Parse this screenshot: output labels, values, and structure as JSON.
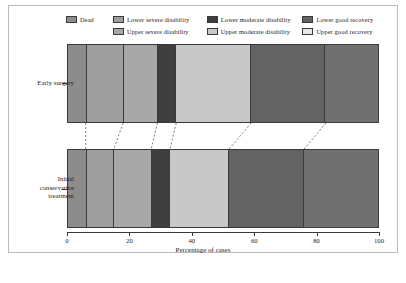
{
  "chart_data": {
    "type": "bar",
    "orientation": "horizontal",
    "stacked": true,
    "title": "",
    "xlabel": "Percentage of cases",
    "ylabel": "",
    "xlim": [
      0,
      100
    ],
    "xticks": [
      0,
      20,
      40,
      60,
      80,
      100
    ],
    "xtick_labels": [
      "0",
      "20",
      "40",
      "60",
      "80",
      "100"
    ],
    "grid": false,
    "legend_position": "top",
    "categories": [
      "Early surgery",
      "Initial conservative treatment"
    ],
    "category_label_lines": [
      [
        "Early surgery"
      ],
      [
        "Initial",
        "conservative",
        "treatment"
      ]
    ],
    "series": [
      {
        "name": "Dead",
        "color": "#8c8c8c",
        "values": [
          6,
          6
        ]
      },
      {
        "name": "Lower severe disability",
        "color": "#9e9e9e",
        "values": [
          12,
          9
        ]
      },
      {
        "name": "Upper severe disability",
        "color": "#a8a8a8",
        "values": [
          11,
          12
        ]
      },
      {
        "name": "Lower moderate disability",
        "color": "#3f3f3f",
        "values": [
          6,
          6
        ]
      },
      {
        "name": "Upper moderate disability",
        "color": "#c8c8c8",
        "values": [
          24,
          19
        ]
      },
      {
        "name": "Lower good recovery",
        "color": "#636363",
        "values": [
          24,
          24
        ]
      },
      {
        "name": "Upper good recovery",
        "color": "#707070",
        "values": [
          17,
          24
        ]
      }
    ],
    "cumulative_boundaries": {
      "Early surgery": [
        6,
        18,
        29,
        35,
        59,
        83,
        100
      ],
      "Initial conservative treatment": [
        6,
        15,
        27,
        33,
        52,
        76,
        100
      ]
    }
  },
  "legend": {
    "rows": [
      [
        {
          "label": "Dead",
          "color": "#8c8c8c",
          "col": "legend-col-a"
        },
        {
          "label": "Lower severe disability",
          "color": "#9e9e9e",
          "col": "legend-col-b"
        },
        {
          "label": "Lower moderate disability",
          "color": "#3f3f3f",
          "col": "legend-col-c"
        },
        {
          "label": "Lower good recovery",
          "color": "#636363",
          "col": "legend-col-d"
        }
      ],
      [
        {
          "label": "",
          "color": "",
          "col": "legend-col-a"
        },
        {
          "label": "Upper severe disability",
          "color": "#a8a8a8",
          "col": "legend-col-b"
        },
        {
          "label": "Upper moderate disability",
          "color": "#c8c8c8",
          "col": "legend-col-c"
        },
        {
          "label": "Upper good recovery",
          "color": "#e8e8e8",
          "col": "legend-col-d"
        }
      ]
    ]
  },
  "axis": {
    "x_title": "Percentage of cases"
  },
  "caption": ""
}
